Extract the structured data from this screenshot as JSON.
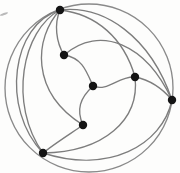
{
  "figure": {
    "type": "graph-diagram",
    "width": 180,
    "height": 173,
    "background_color": "#fdfdfc",
    "edge_color": "#7d7d7d",
    "vertex_color": "#141414",
    "boundary_color": "#8a8a8a",
    "vertex_radius": 4.2,
    "edge_stroke_width": 1.35,
    "vertex_count": 7,
    "edge_count": 14
  },
  "boundary": {
    "shape": "circle",
    "cx": 89,
    "cy": 88,
    "r": 84
  },
  "vertices": [
    {
      "id": "v1",
      "label": "top",
      "cx": 60,
      "cy": 10
    },
    {
      "id": "v2",
      "label": "upper-left-inner",
      "cx": 64,
      "cy": 55
    },
    {
      "id": "v3",
      "label": "center",
      "cx": 93,
      "cy": 86
    },
    {
      "id": "v4",
      "label": "upper-right-inner",
      "cx": 135,
      "cy": 77
    },
    {
      "id": "v5",
      "label": "right",
      "cx": 172,
      "cy": 100
    },
    {
      "id": "v6",
      "label": "lower-inner",
      "cx": 83,
      "cy": 125
    },
    {
      "id": "v7",
      "label": "bottom-left",
      "cx": 43,
      "cy": 153
    }
  ],
  "edges": [
    {
      "id": "e1",
      "from": "v1",
      "to": "v5",
      "path": "M 60 10 C 104 5 150 36 172 100"
    },
    {
      "id": "e2",
      "from": "v1",
      "to": "v4",
      "path": "M 60 10 C 96 14 124 38 135 77"
    },
    {
      "id": "e3",
      "from": "v1",
      "to": "v2",
      "path": "M 60 10 C 54 24 56 42 64 55"
    },
    {
      "id": "e4",
      "from": "v1",
      "to": "v6",
      "path": "M 60 10 C 34 38 30 92 83 125"
    },
    {
      "id": "e5",
      "from": "v1",
      "to": "v7",
      "path": "M 60 10 C 22 30 8 104 43 153"
    },
    {
      "id": "e6",
      "from": "v1",
      "to": "v7",
      "path": "M 60 10 C 12 24 0 108 43 153"
    },
    {
      "id": "e7",
      "from": "v2",
      "to": "v3",
      "path": "M 64 55 C 82 58 86 70 93 86"
    },
    {
      "id": "e8",
      "from": "v2",
      "to": "v5",
      "path": "M 64 55 C 100 24 146 44 172 100"
    },
    {
      "id": "e9",
      "from": "v3",
      "to": "v4",
      "path": "M 93 86 C 108 92 118 76 135 77"
    },
    {
      "id": "e10",
      "from": "v3",
      "to": "v6",
      "path": "M 93 86 C 80 98 76 110 83 125"
    },
    {
      "id": "e11",
      "from": "v4",
      "to": "v5",
      "path": "M 135 77 C 150 80 162 88 172 100"
    },
    {
      "id": "e12",
      "from": "v4",
      "to": "v7",
      "path": "M 135 77 C 140 120 104 152 43 153"
    },
    {
      "id": "e13",
      "from": "v6",
      "to": "v7",
      "path": "M 83 125 C 70 134 54 144 43 153"
    },
    {
      "id": "e14",
      "from": "v5",
      "to": "v7",
      "path": "M 172 100 C 162 146 108 174 43 153"
    }
  ],
  "artifacts": [
    {
      "id": "a1",
      "label": "scan-speck",
      "cx": 4,
      "cy": 14,
      "rx": 4.2,
      "ry": 1.1
    }
  ]
}
